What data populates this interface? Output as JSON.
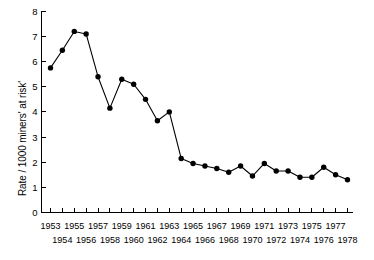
{
  "chart_data": {
    "type": "line",
    "title": "",
    "subtitle": "",
    "xlabel": "",
    "ylabel": "Rate / 1000 miners' at risk'",
    "x": [
      1953,
      1954,
      1955,
      1956,
      1957,
      1958,
      1959,
      1960,
      1961,
      1962,
      1963,
      1964,
      1965,
      1966,
      1967,
      1968,
      1969,
      1970,
      1971,
      1972,
      1973,
      1974,
      1975,
      1976,
      1977,
      1978
    ],
    "values": [
      5.75,
      6.45,
      7.2,
      7.1,
      5.4,
      4.15,
      5.3,
      5.1,
      4.5,
      3.65,
      4.0,
      2.15,
      1.95,
      1.85,
      1.75,
      1.6,
      1.85,
      1.45,
      1.95,
      1.65,
      1.65,
      1.4,
      1.4,
      1.8,
      1.5,
      1.3
    ],
    "series": [
      {
        "name": "Rate per 1000 miners at risk",
        "values": [
          5.75,
          6.45,
          7.2,
          7.1,
          5.4,
          4.15,
          5.3,
          5.1,
          4.5,
          3.65,
          4.0,
          2.15,
          1.95,
          1.85,
          1.75,
          1.6,
          1.85,
          1.45,
          1.95,
          1.65,
          1.65,
          1.4,
          1.4,
          1.8,
          1.5,
          1.3
        ],
        "marker": "filled-circle",
        "color": "#000000"
      }
    ],
    "xlim": [
      1952.5,
      1978.5
    ],
    "ylim": [
      0,
      8
    ],
    "yticks": [
      0,
      1,
      2,
      3,
      4,
      5,
      6,
      7,
      8
    ],
    "ytick_labels": [
      "0",
      "1",
      "2",
      "3",
      "4",
      "5",
      "6",
      "7",
      "8"
    ],
    "xticks": [
      1953,
      1954,
      1955,
      1956,
      1957,
      1958,
      1959,
      1960,
      1961,
      1962,
      1963,
      1964,
      1965,
      1966,
      1967,
      1968,
      1969,
      1970,
      1971,
      1972,
      1973,
      1974,
      1975,
      1976,
      1977,
      1978
    ],
    "xtick_labels_top": [
      "1953",
      "1955",
      "1957",
      "1959",
      "1961",
      "1963",
      "1965",
      "1967",
      "1969",
      "1971",
      "1973",
      "1975",
      "1977"
    ],
    "xtick_labels_bottom": [
      "1954",
      "1956",
      "1958",
      "1960",
      "1962",
      "1964",
      "1966",
      "1968",
      "1970",
      "1972",
      "1974",
      "1976",
      "1978"
    ],
    "grid": false,
    "legend": "none",
    "annotations": []
  }
}
